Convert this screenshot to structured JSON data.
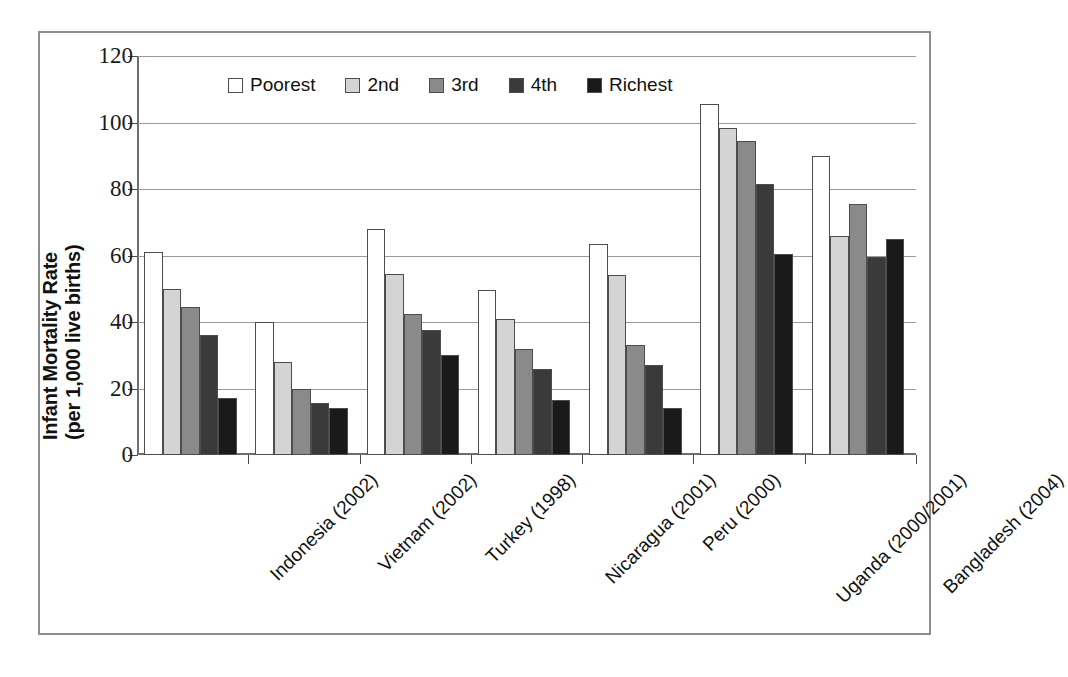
{
  "chart_data": {
    "type": "bar",
    "title": "",
    "subtitle": "",
    "xlabel": "",
    "ylabel": "Infant Mortality Rate (per 1,000 live births)",
    "ylabel_lines": [
      "Infant Mortality Rate",
      "(per 1,000 live births)"
    ],
    "ylim": [
      0,
      120
    ],
    "ytick_values": [
      0,
      20,
      40,
      60,
      80,
      100,
      120
    ],
    "ytick_labels": [
      "0",
      "20",
      "40",
      "60",
      "80",
      "100",
      "120"
    ],
    "grid": true,
    "legend_position": "top-left-inside",
    "categories": [
      "Indonesia (2002)",
      "Vietnam (2002)",
      "Turkey (1998)",
      "Nicaragua (2001)",
      "Peru (2000)",
      "Uganda (2000/2001)",
      "Bangladesh (2004)"
    ],
    "series": [
      {
        "name": "Poorest",
        "color": "#ffffff",
        "values": [
          61,
          40,
          68,
          49.5,
          63.5,
          105.5,
          90
        ]
      },
      {
        "name": "2nd",
        "color": "#d4d4d4",
        "values": [
          50,
          28,
          54.5,
          41,
          54,
          98.5,
          66
        ]
      },
      {
        "name": "3rd",
        "color": "#8a8a8a",
        "values": [
          44.5,
          20,
          42.5,
          32,
          33,
          94.5,
          75.5
        ]
      },
      {
        "name": "4th",
        "color": "#3a3a3a",
        "values": [
          36,
          15.5,
          37.5,
          26,
          27,
          81.5,
          59.5
        ]
      },
      {
        "name": "Richest",
        "color": "#1a1a1a",
        "values": [
          17,
          14,
          30,
          16.5,
          14,
          60.5,
          65
        ]
      }
    ]
  },
  "style": {
    "frame_color": "#8d8d8d",
    "axis_color": "#6e6e6e",
    "grid_color": "#9a9a9a",
    "bar_outline": "#4d4d4d",
    "text_color": "#111111",
    "background": "#ffffff"
  }
}
